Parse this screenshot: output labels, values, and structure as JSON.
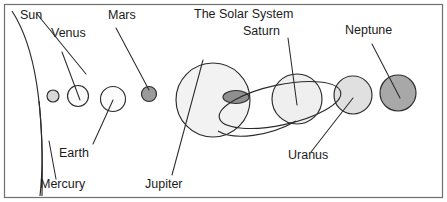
{
  "diagram": {
    "title": "The Solar System",
    "frame": {
      "border_color": "#6f6f6f"
    },
    "background_color": "#ffffff",
    "line_color": "#2b2b2b",
    "labels": {
      "sun": "Sun",
      "mercury": "Mercury",
      "venus": "Venus",
      "earth": "Earth",
      "mars": "Mars",
      "jupiter": "Jupiter",
      "saturn": "Saturn",
      "uranus": "Uranus",
      "neptune": "Neptune"
    },
    "bodies": [
      {
        "name": "Sun",
        "shape": "arc",
        "fill": "#ffffff",
        "note": "large arc at left edge, only limb visible"
      },
      {
        "name": "Mercury",
        "shape": "circle",
        "cx": 53,
        "cy": 96,
        "r": 6,
        "fill": "#d8d8d8"
      },
      {
        "name": "Venus",
        "shape": "circle",
        "cx": 78,
        "cy": 96,
        "r": 10.5,
        "fill": "#fbfbfb"
      },
      {
        "name": "Earth",
        "shape": "circle",
        "cx": 113,
        "cy": 99,
        "r": 12.5,
        "fill": "#fbfbfb"
      },
      {
        "name": "Mars",
        "shape": "circle",
        "cx": 149,
        "cy": 94,
        "r": 7.5,
        "fill": "#9a9a9a"
      },
      {
        "name": "Jupiter",
        "shape": "circle",
        "cx": 213,
        "cy": 100,
        "r": 37,
        "fill": "#f2f2f2"
      },
      {
        "name": "Great Red Spot",
        "shape": "ellipse",
        "cx": 236,
        "cy": 97,
        "rx": 13,
        "ry": 6.5,
        "fill": "#8f8f8f"
      },
      {
        "name": "Saturn",
        "shape": "circle",
        "cx": 297,
        "cy": 99,
        "r": 25,
        "fill": "#efefef"
      },
      {
        "name": "Saturn rings",
        "shape": "ellipse-outline",
        "cx": 280,
        "cy": 105,
        "rx": 62,
        "ry": 20,
        "rotation": -12
      },
      {
        "name": "Uranus",
        "shape": "circle",
        "cx": 353,
        "cy": 95,
        "r": 19,
        "fill": "#e0e0e0"
      },
      {
        "name": "Neptune",
        "shape": "circle",
        "cx": 398,
        "cy": 93,
        "r": 18,
        "fill": "#a8a8a8"
      }
    ]
  }
}
